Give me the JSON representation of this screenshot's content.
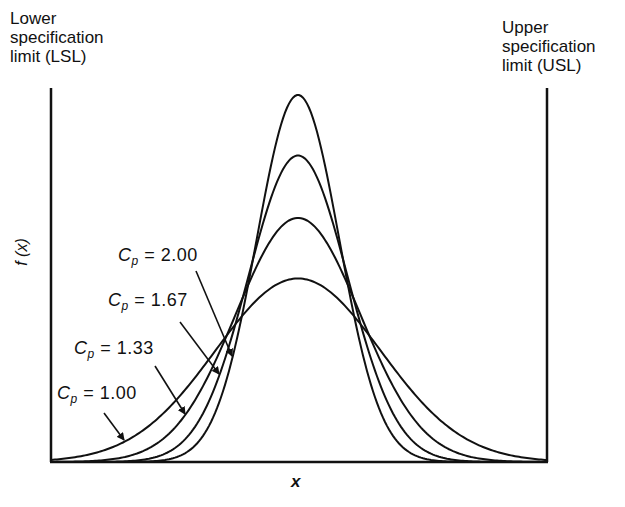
{
  "labels": {
    "lsl": [
      "Lower",
      "specification",
      "limit (LSL)"
    ],
    "usl": [
      "Upper",
      "specification",
      "limit (USL)"
    ],
    "y_axis": "f (x)",
    "x_axis": "x"
  },
  "curves": [
    {
      "name": "Cp = 2.00",
      "symbol": "C",
      "subscript": "p",
      "eq": "=",
      "value": "2.00"
    },
    {
      "name": "Cp = 1.67",
      "symbol": "C",
      "subscript": "p",
      "eq": "=",
      "value": "1.67"
    },
    {
      "name": "Cp = 1.33",
      "symbol": "C",
      "subscript": "p",
      "eq": "=",
      "value": "1.33"
    },
    {
      "name": "Cp = 1.00",
      "symbol": "C",
      "subscript": "p",
      "eq": "=",
      "value": "1.00"
    }
  ],
  "chart_data": {
    "type": "line",
    "title": "",
    "xlabel": "x",
    "ylabel": "f(x)",
    "annotations": [
      "Lower specification limit (LSL)",
      "Upper specification limit (USL)"
    ],
    "series": [
      {
        "name": "Cp = 2.00",
        "cp": 2.0,
        "relative_peak": 2.0
      },
      {
        "name": "Cp = 1.67",
        "cp": 1.67,
        "relative_peak": 1.67
      },
      {
        "name": "Cp = 1.33",
        "cp": 1.33,
        "relative_peak": 1.33
      },
      {
        "name": "Cp = 1.00",
        "cp": 1.0,
        "relative_peak": 1.0
      }
    ],
    "grid": false,
    "legend": "inline arrow labels at left"
  }
}
